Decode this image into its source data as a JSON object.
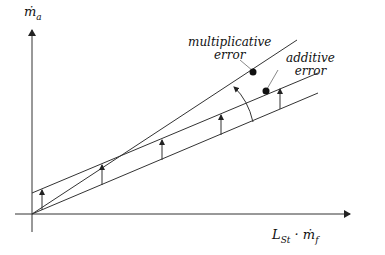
{
  "diagram": {
    "axes": {
      "y_label": "ṁ",
      "y_label_sub": "a",
      "x_label": "L",
      "x_label_sub": "St",
      "x_label_rest": " · ṁ",
      "x_label_rest_sub": "f"
    },
    "labels": {
      "multiplicative_line1": "multiplicative",
      "multiplicative_line2": "error",
      "additive_line1": "additive",
      "additive_line2": "error"
    },
    "lines": [
      {
        "name": "true-line",
        "from": [
          32,
          214
        ],
        "to": [
          318,
          93
        ]
      },
      {
        "name": "additive-error-line",
        "from": [
          32,
          193
        ],
        "to": [
          318,
          73
        ]
      },
      {
        "name": "multiplicative-error-line",
        "from": [
          32,
          214
        ],
        "to": [
          297,
          40
        ]
      }
    ],
    "color": "#222222"
  }
}
